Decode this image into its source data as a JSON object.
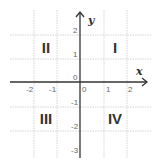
{
  "diagram": {
    "axes": {
      "x_label": "x",
      "y_label": "y",
      "x_ticks": [
        "-2",
        "-1",
        "0",
        "1",
        "2"
      ],
      "y_ticks": [
        "2",
        "1",
        "0",
        "-1",
        "-2",
        "-3"
      ]
    },
    "quadrants": {
      "q1": "I",
      "q2": "II",
      "q3": "III",
      "q4": "IV"
    },
    "colors": {
      "axis": "#333333",
      "grid": "#d4d4d4",
      "text": "#333333",
      "tick_text": "#666666"
    }
  }
}
